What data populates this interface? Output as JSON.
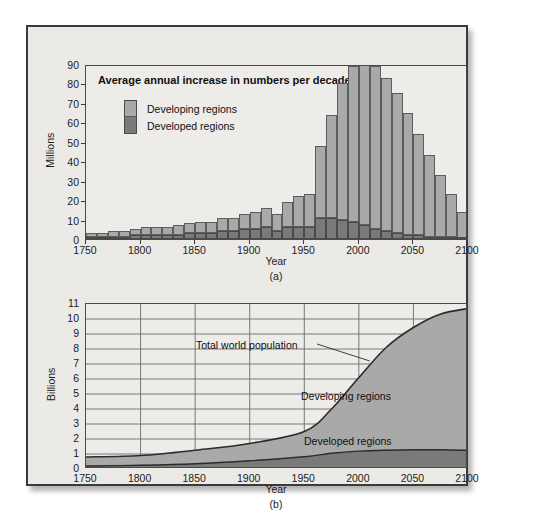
{
  "figure": {
    "background_color": "#ffffff",
    "panel_color": "#eceae6",
    "border_color": "#3a3a3a"
  },
  "colors": {
    "developing": "#a9a9a9",
    "developed": "#7a7a7a",
    "grid": "#6b6b6b",
    "axis": "#3b3b3b",
    "text": "#101010"
  },
  "chart_data": [
    {
      "id": "chart-a",
      "type": "bar",
      "title": "Average annual increase in numbers per decade",
      "caption": "(a)",
      "xlabel": "Year",
      "ylabel": "Millions",
      "stacked": true,
      "grid": false,
      "xlim": [
        1750,
        2100
      ],
      "ylim": [
        0,
        90
      ],
      "yticks": [
        0,
        10,
        20,
        30,
        40,
        50,
        60,
        70,
        80,
        90
      ],
      "xticks": [
        1750,
        1800,
        1850,
        1900,
        1950,
        2000,
        2050,
        2100
      ],
      "legend": {
        "position": "upper-left-inside",
        "entries": [
          {
            "label": "Developing regions",
            "color": "#a9a9a9"
          },
          {
            "label": "Developed regions",
            "color": "#7a7a7a"
          }
        ]
      },
      "categories": [
        1750,
        1760,
        1770,
        1780,
        1790,
        1800,
        1810,
        1820,
        1830,
        1840,
        1850,
        1860,
        1870,
        1880,
        1890,
        1900,
        1910,
        1920,
        1930,
        1940,
        1950,
        1960,
        1970,
        1980,
        1990,
        2000,
        2010,
        2020,
        2030,
        2040,
        2050,
        2060,
        2070,
        2080,
        2090
      ],
      "series": [
        {
          "name": "Developing regions",
          "values": [
            2,
            2,
            3,
            3,
            3,
            4,
            4,
            4,
            5,
            5,
            6,
            6,
            7,
            7,
            8,
            9,
            10,
            9,
            13,
            16,
            17,
            37,
            53,
            70,
            80,
            86,
            84,
            79,
            72,
            63,
            52,
            42,
            32,
            22,
            14
          ]
        },
        {
          "name": "Developed regions",
          "values": [
            1,
            1,
            1,
            1,
            2,
            2,
            2,
            2,
            2,
            3,
            3,
            3,
            4,
            4,
            5,
            5,
            6,
            4,
            6,
            6,
            6,
            11,
            11,
            10,
            9,
            7,
            5,
            4,
            3,
            2,
            2,
            1,
            1,
            1,
            0
          ]
        }
      ],
      "totals": [
        3,
        3,
        4,
        4,
        5,
        6,
        6,
        6,
        7,
        8,
        9,
        9,
        11,
        11,
        13,
        14,
        16,
        13,
        19,
        22,
        23,
        48,
        64,
        80,
        89,
        87,
        85,
        80,
        70,
        62,
        51,
        40,
        30,
        20,
        11
      ],
      "peak": {
        "year": 1990,
        "value": 89
      }
    },
    {
      "id": "chart-b",
      "type": "area",
      "caption": "(b)",
      "xlabel": "Year",
      "ylabel": "Billions",
      "stacked": true,
      "grid": true,
      "xlim": [
        1750,
        2100
      ],
      "ylim": [
        0,
        11
      ],
      "yticks": [
        0,
        1,
        2,
        3,
        4,
        5,
        6,
        7,
        8,
        9,
        10,
        11
      ],
      "xticks": [
        1750,
        1800,
        1850,
        1900,
        1950,
        2000,
        2050,
        2100
      ],
      "annotations": [
        {
          "text": "Total world population",
          "target_year": 2010,
          "target_value": 7.2
        },
        {
          "text": "Developing regions",
          "kind": "area-label"
        },
        {
          "text": "Developed regions",
          "kind": "area-label"
        }
      ],
      "x": [
        1750,
        1800,
        1850,
        1900,
        1950,
        1975,
        2000,
        2025,
        2050,
        2075,
        2100
      ],
      "series": [
        {
          "name": "Developed regions",
          "values": [
            0.2,
            0.25,
            0.35,
            0.55,
            0.82,
            1.05,
            1.19,
            1.25,
            1.28,
            1.28,
            1.25
          ]
        },
        {
          "name": "Developing regions",
          "values": [
            0.6,
            0.65,
            0.9,
            1.15,
            1.68,
            2.95,
            4.91,
            6.85,
            8.15,
            9.05,
            9.45
          ]
        }
      ],
      "totals": [
        0.8,
        0.9,
        1.25,
        1.7,
        2.5,
        4.0,
        6.1,
        8.1,
        9.43,
        10.33,
        10.7
      ]
    }
  ],
  "chart_a": {
    "title": "Average annual increase in numbers per decade",
    "ylabel": "Millions",
    "xlabel": "Year",
    "caption": "(a)",
    "legend_developing": "Developing regions",
    "legend_developed": "Developed regions"
  },
  "chart_b": {
    "ylabel": "Billions",
    "xlabel": "Year",
    "caption": "(b)",
    "annotation_total": "Total world population",
    "label_developing": "Developing regions",
    "label_developed": "Developed regions"
  }
}
